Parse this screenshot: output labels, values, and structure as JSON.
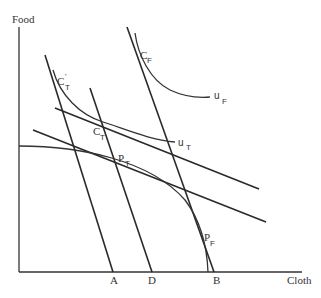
{
  "diagram": {
    "type": "economics-trade-diagram",
    "axes": {
      "y_label": "Food",
      "x_label": "Cloth"
    },
    "x_axis_points": [
      {
        "label": "A"
      },
      {
        "label": "D"
      },
      {
        "label": "B"
      }
    ],
    "points": [
      {
        "id": "CT_prime",
        "main": "C",
        "sub": "T",
        "prime": "'"
      },
      {
        "id": "CT",
        "main": "C",
        "sub": "T"
      },
      {
        "id": "CF",
        "main": "C",
        "sub": "F"
      },
      {
        "id": "PT",
        "main": "P",
        "sub": "T"
      },
      {
        "id": "PF",
        "main": "P",
        "sub": "F"
      }
    ],
    "curves": [
      {
        "id": "uT",
        "main": "u",
        "sub": "T",
        "kind": "indifference-curve"
      },
      {
        "id": "uF",
        "main": "u",
        "sub": "F",
        "kind": "indifference-curve"
      },
      {
        "id": "ppf",
        "kind": "production-possibility-frontier"
      }
    ],
    "lines": [
      {
        "id": "line-A",
        "kind": "steep-price-line"
      },
      {
        "id": "line-D",
        "kind": "steep-price-line"
      },
      {
        "id": "line-B",
        "kind": "steep-price-line"
      },
      {
        "id": "upper-flat",
        "kind": "flat-price-line"
      },
      {
        "id": "lower-flat",
        "kind": "flat-price-line"
      }
    ]
  }
}
